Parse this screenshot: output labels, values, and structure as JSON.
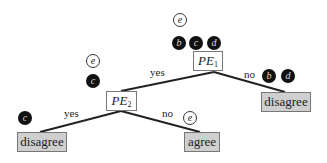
{
  "nodes": {
    "pe1": {
      "main": "PE",
      "sub": "1"
    },
    "pe2": {
      "main": "PE",
      "sub": "2"
    },
    "leaf_right": "disagree",
    "leaf_left": "disagree",
    "leaf_mid": "agree"
  },
  "edges": {
    "pe1_yes": "yes",
    "pe1_no": "no",
    "pe2_yes": "yes",
    "pe2_no": "no"
  },
  "tokens": {
    "root_light": [
      "e"
    ],
    "root_dark": [
      "b",
      "c",
      "d"
    ],
    "pe2_light": [
      "e"
    ],
    "pe2_dark": [
      "c"
    ],
    "right_dark": [
      "b",
      "d"
    ],
    "left_dark": [
      "c"
    ],
    "mid_light": [
      "e"
    ]
  },
  "colors": {
    "leaf_fill": "#cfcfcf",
    "dark_token": "#111111",
    "line": "#222222"
  }
}
